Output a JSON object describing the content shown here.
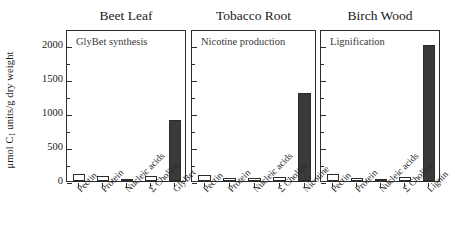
{
  "figure": {
    "ylabel_text": "μmol C",
    "ylabel_sub": "1",
    "ylabel_tail": " units/g dry weight",
    "ylabel_full": "μmol C1 units/g dry weight"
  },
  "chart_data": {
    "type": "bar",
    "title": "",
    "xlabel": "",
    "ylabel": "μmol C1 units/g dry weight",
    "ylim": [
      0,
      2100
    ],
    "yticks": [
      0,
      500,
      1000,
      1500,
      2000
    ],
    "ytick_labels": [
      "0",
      "500",
      "1000",
      "1500",
      "2000"
    ],
    "grid": false,
    "legend": "none",
    "panels": [
      {
        "title": "Beet Leaf",
        "note": "GlyBet synthesis",
        "categories": [
          "Pectin",
          "Protein",
          "Nucleic acids",
          "Σ Choline",
          "GlyBet"
        ],
        "values": [
          110,
          70,
          25,
          70,
          900
        ],
        "styles": [
          "open",
          "open",
          "open",
          "open",
          "filled"
        ]
      },
      {
        "title": "Tobacco Root",
        "note": "Nicotine production",
        "categories": [
          "Pectin",
          "Protein",
          "Nucleic acids",
          "Σ Choline",
          "Nicotine"
        ],
        "values": [
          90,
          45,
          40,
          55,
          1300
        ],
        "styles": [
          "open",
          "open",
          "open",
          "open",
          "filled"
        ]
      },
      {
        "title": "Birch Wood",
        "note": "Lignification",
        "categories": [
          "Pectin",
          "Protein",
          "Nucleic acids",
          "Σ Choline",
          "Lignin"
        ],
        "values": [
          105,
          40,
          30,
          60,
          2000
        ],
        "styles": [
          "open",
          "open",
          "open",
          "open",
          "filled"
        ]
      }
    ]
  },
  "colors": {
    "axis": "#2b2b2b",
    "bar_filled": "#3a3a3a",
    "bar_open": "#ffffff",
    "text": "#1a1a1a",
    "background": "#ffffff"
  }
}
